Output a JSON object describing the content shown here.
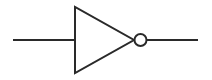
{
  "diagram": {
    "type": "logic-gate",
    "gate": "NOT",
    "symbol_name": "inverter",
    "stroke_color": "#2a2a2a",
    "background_color": "#ffffff",
    "input_line": {
      "x1": 13,
      "y1": 40,
      "x2": 75,
      "y2": 40
    },
    "triangle": {
      "points": "75,7 75,73 134,40"
    },
    "bubble": {
      "cx": 140.5,
      "cy": 40,
      "r": 6
    },
    "output_line": {
      "x1": 146.5,
      "y1": 40,
      "x2": 198,
      "y2": 40
    }
  }
}
